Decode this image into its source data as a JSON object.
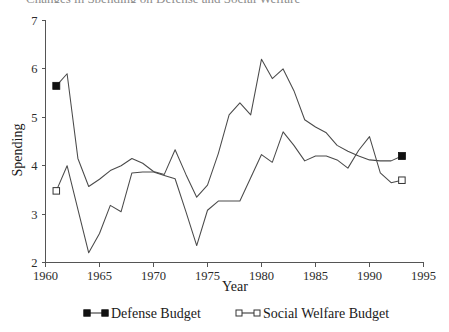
{
  "figure": {
    "title_fragment": "Changes in Spending on Defense and Social Welfare",
    "background": "#ffffff",
    "ink_color": "#4a4a4a"
  },
  "chart_data": {
    "type": "line",
    "title": "",
    "xlabel": "Year",
    "ylabel": "Spending",
    "xlim": [
      1960,
      1995
    ],
    "ylim": [
      2,
      7
    ],
    "xticks": [
      1960,
      1965,
      1970,
      1975,
      1980,
      1985,
      1990,
      1995
    ],
    "yticks": [
      2,
      3,
      4,
      5,
      6,
      7
    ],
    "grid": false,
    "legend_position": "bottom",
    "x": [
      1961,
      1962,
      1963,
      1964,
      1965,
      1966,
      1967,
      1968,
      1969,
      1970,
      1971,
      1972,
      1973,
      1974,
      1975,
      1976,
      1977,
      1978,
      1979,
      1980,
      1981,
      1982,
      1983,
      1984,
      1985,
      1986,
      1987,
      1988,
      1989,
      1990,
      1991,
      1992,
      1993
    ],
    "series": [
      {
        "name": "Defense Budget",
        "marker": "filled-square",
        "marker_years": [
          1961,
          1993
        ],
        "values": [
          5.65,
          5.9,
          4.15,
          3.57,
          3.72,
          3.9,
          4.0,
          4.15,
          4.05,
          3.88,
          3.82,
          4.33,
          3.82,
          3.35,
          3.6,
          4.25,
          5.05,
          5.3,
          5.05,
          6.2,
          5.8,
          6.0,
          5.55,
          4.95,
          4.8,
          4.68,
          4.42,
          4.3,
          4.2,
          4.12,
          4.1,
          4.1,
          4.2
        ]
      },
      {
        "name": "Social Welfare Budget",
        "marker": "open-square",
        "marker_years": [
          1961,
          1993
        ],
        "values": [
          3.48,
          4.0,
          3.1,
          2.2,
          2.6,
          3.18,
          3.05,
          3.85,
          3.87,
          3.87,
          3.8,
          3.73,
          3.05,
          2.35,
          3.08,
          3.27,
          3.27,
          3.27,
          3.75,
          4.23,
          4.07,
          4.7,
          4.42,
          4.1,
          4.2,
          4.2,
          4.12,
          3.95,
          4.32,
          4.6,
          3.85,
          3.65,
          3.7
        ]
      }
    ],
    "annotations": []
  },
  "legend": {
    "items": [
      {
        "label": "Defense Budget",
        "marker": "filled-square"
      },
      {
        "label": "Social Welfare Budget",
        "marker": "open-square"
      }
    ]
  }
}
